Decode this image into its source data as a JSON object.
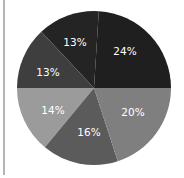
{
  "chart_data": {
    "type": "pie",
    "title": "",
    "legend": "none",
    "start_angle_deg": 0,
    "direction": "counterclockwise",
    "slices": [
      {
        "label": "24%",
        "value": 24,
        "color": "#1f1f1f",
        "label_pos": [
          125,
          52
        ]
      },
      {
        "label": "13%",
        "value": 13,
        "color": "#242424",
        "label_pos": [
          75,
          43
        ]
      },
      {
        "label": "13%",
        "value": 13,
        "color": "#3e3e3e",
        "label_pos": [
          48,
          73
        ]
      },
      {
        "label": "14%",
        "value": 14,
        "color": "#9b9b9b",
        "label_pos": [
          53,
          111
        ]
      },
      {
        "label": "16%",
        "value": 16,
        "color": "#5b5b5b",
        "label_pos": [
          89,
          133
        ]
      },
      {
        "label": "20%",
        "value": 20,
        "color": "#7f7f7f",
        "label_pos": [
          133,
          113
        ]
      }
    ],
    "center": [
      94,
      88
    ],
    "radius": 77
  }
}
